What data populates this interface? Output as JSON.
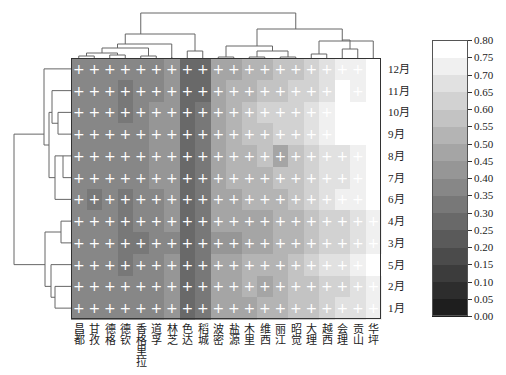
{
  "chart_data": {
    "type": "heatmap",
    "title": "",
    "xlabel": "",
    "ylabel": "",
    "columns": [
      "昌都",
      "甘孜",
      "德格",
      "德钦",
      "香格里拉",
      "道孚",
      "林芝",
      "色达",
      "稻城",
      "波密",
      "盐源",
      "木里",
      "维西",
      "丽江",
      "昭觉",
      "大理",
      "越西",
      "会理",
      "贡山",
      "华坪"
    ],
    "rows": [
      "12月",
      "11月",
      "10月",
      "9月",
      "8月",
      "7月",
      "6月",
      "4月",
      "3月",
      "5月",
      "2月",
      "1月"
    ],
    "values": [
      [
        0.35,
        0.35,
        0.35,
        0.35,
        0.35,
        0.35,
        0.4,
        0.25,
        0.25,
        0.45,
        0.45,
        0.5,
        0.5,
        0.55,
        0.55,
        0.6,
        0.65,
        0.7,
        0.7,
        0.8
      ],
      [
        0.35,
        0.35,
        0.35,
        0.3,
        0.35,
        0.35,
        0.4,
        0.25,
        0.25,
        0.45,
        0.5,
        0.5,
        0.55,
        0.55,
        0.6,
        0.6,
        0.65,
        0.75,
        0.7,
        0.8
      ],
      [
        0.35,
        0.35,
        0.35,
        0.3,
        0.35,
        0.4,
        0.4,
        0.25,
        0.3,
        0.45,
        0.5,
        0.55,
        0.6,
        0.6,
        0.6,
        0.65,
        0.7,
        0.75,
        0.75,
        0.8
      ],
      [
        0.35,
        0.35,
        0.35,
        0.35,
        0.35,
        0.4,
        0.4,
        0.25,
        0.3,
        0.45,
        0.5,
        0.55,
        0.55,
        0.6,
        0.6,
        0.65,
        0.7,
        0.75,
        0.75,
        0.8
      ],
      [
        0.35,
        0.35,
        0.35,
        0.35,
        0.35,
        0.4,
        0.4,
        0.25,
        0.3,
        0.45,
        0.5,
        0.5,
        0.55,
        0.45,
        0.55,
        0.6,
        0.65,
        0.65,
        0.7,
        0.75
      ],
      [
        0.35,
        0.35,
        0.35,
        0.35,
        0.35,
        0.4,
        0.4,
        0.25,
        0.3,
        0.45,
        0.5,
        0.5,
        0.5,
        0.55,
        0.55,
        0.6,
        0.65,
        0.65,
        0.7,
        0.75
      ],
      [
        0.35,
        0.3,
        0.35,
        0.3,
        0.35,
        0.35,
        0.4,
        0.25,
        0.3,
        0.45,
        0.45,
        0.5,
        0.5,
        0.5,
        0.55,
        0.6,
        0.65,
        0.7,
        0.7,
        0.75
      ],
      [
        0.35,
        0.35,
        0.35,
        0.3,
        0.35,
        0.35,
        0.4,
        0.25,
        0.3,
        0.45,
        0.45,
        0.45,
        0.45,
        0.5,
        0.5,
        0.55,
        0.6,
        0.6,
        0.65,
        0.7
      ],
      [
        0.35,
        0.35,
        0.35,
        0.3,
        0.3,
        0.35,
        0.35,
        0.25,
        0.3,
        0.4,
        0.4,
        0.45,
        0.45,
        0.5,
        0.5,
        0.55,
        0.6,
        0.6,
        0.65,
        0.7
      ],
      [
        0.35,
        0.35,
        0.35,
        0.3,
        0.35,
        0.35,
        0.4,
        0.25,
        0.3,
        0.45,
        0.45,
        0.5,
        0.5,
        0.5,
        0.55,
        0.6,
        0.65,
        0.65,
        0.7,
        0.75
      ],
      [
        0.35,
        0.35,
        0.35,
        0.35,
        0.35,
        0.35,
        0.4,
        0.25,
        0.3,
        0.45,
        0.45,
        0.5,
        0.45,
        0.5,
        0.55,
        0.55,
        0.6,
        0.6,
        0.65,
        0.7
      ],
      [
        0.35,
        0.35,
        0.35,
        0.35,
        0.35,
        0.35,
        0.4,
        0.25,
        0.3,
        0.45,
        0.45,
        0.45,
        0.5,
        0.5,
        0.55,
        0.55,
        0.6,
        0.65,
        0.65,
        0.7
      ]
    ],
    "cell_marker": "+",
    "colormap": "gray",
    "vmin": 0.0,
    "vmax": 0.8,
    "colorbar": {
      "ticks": [
        "0.00",
        "0.05",
        "0.10",
        "0.15",
        "0.20",
        "0.25",
        "0.30",
        "0.35",
        "0.40",
        "0.45",
        "0.50",
        "0.55",
        "0.60",
        "0.65",
        "0.70",
        "0.75",
        "0.80"
      ],
      "position": "right",
      "levels": 16
    },
    "row_dendrogram": true,
    "col_dendrogram": true,
    "grid": false
  }
}
